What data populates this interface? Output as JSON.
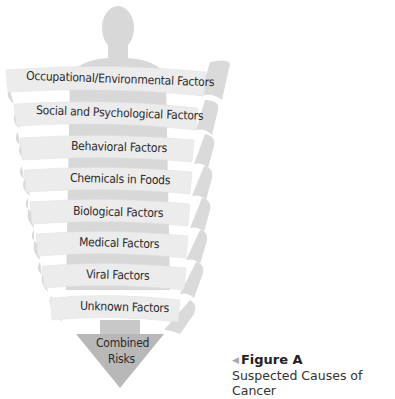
{
  "diagram": {
    "type": "spiral-ribbon",
    "bands": [
      {
        "label": "Occupational/Environmental Factors"
      },
      {
        "label": "Social and Psychological Factors"
      },
      {
        "label": "Behavioral Factors"
      },
      {
        "label": "Chemicals in Foods"
      },
      {
        "label": "Biological Factors"
      },
      {
        "label": "Medical Factors"
      },
      {
        "label": "Viral Factors"
      },
      {
        "label": "Unknown Factors"
      }
    ],
    "result": {
      "line1": "Combined",
      "line2": "Risks"
    },
    "colors": {
      "silhouette": "#d6d6d6",
      "ribbon_front": "#ececec",
      "ribbon_back": "#d9d9d9",
      "arrow": "#b5b5b5",
      "text": "#2a2a2a"
    }
  },
  "caption": {
    "marker": "◀",
    "title": "Figure A",
    "subtitle": "Suspected Causes of Cancer"
  }
}
